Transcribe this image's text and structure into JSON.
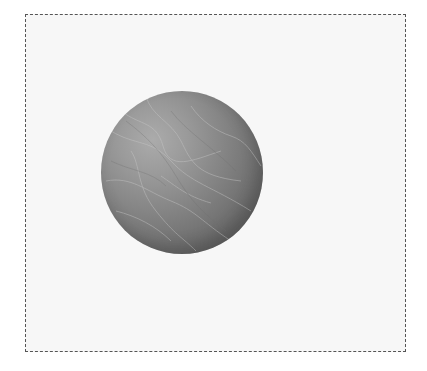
{
  "scene": {
    "frame": {
      "border_style": "dashed",
      "border_color": "#555555",
      "background_color": "#f7f7f7"
    },
    "sphere": {
      "description": "grayscale marble-textured sphere",
      "highlight_color": "#ababab",
      "shadow_color": "#555555",
      "center": [
        182,
        173
      ],
      "radius": 81
    }
  }
}
